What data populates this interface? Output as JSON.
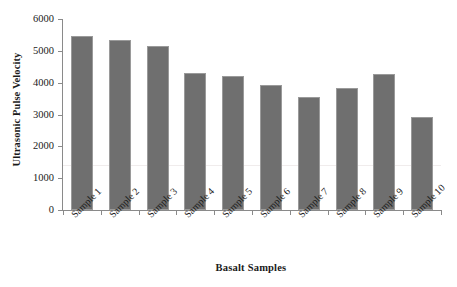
{
  "chart_data": {
    "type": "bar",
    "title": "",
    "xlabel": "Basalt Samples",
    "ylabel": "Ultrasonic Pulse Velocity",
    "categories": [
      "Sample 1",
      "Sample 2",
      "Sample 3",
      "Sample 4",
      "Sample 5",
      "Sample 6",
      "Sample 7",
      "Sample 8",
      "Sample 9",
      "Sample 10"
    ],
    "values": [
      5470,
      5340,
      5150,
      4300,
      4210,
      3930,
      3560,
      3830,
      4260,
      2910
    ],
    "ylim": [
      0,
      6000
    ],
    "ytick_labels": [
      "0",
      "1000",
      "2000",
      "3000",
      "4000",
      "5000",
      "6000"
    ],
    "ytick_values": [
      0,
      1000,
      2000,
      3000,
      4000,
      5000,
      6000
    ],
    "grid": false,
    "legend": false,
    "legend_position": "none",
    "bar_color": "#6f6f6f",
    "bar_border_color": "#9a9a9a",
    "axis_color": "#8a8a8a",
    "background_color": "#ffffff",
    "xtick_label_rotation": -45
  }
}
